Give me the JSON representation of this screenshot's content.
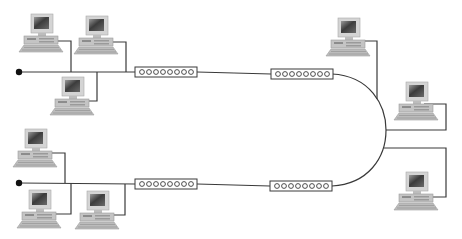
{
  "diagram": {
    "type": "network-topology",
    "background": "#ffffff",
    "line_color": "#3a3a3a",
    "segments": [
      {
        "name": "upper-bus",
        "terminator": {
          "x": 19,
          "y": 72
        },
        "bus_y": 72,
        "workstations": [
          {
            "id": "ws-upper-1",
            "x": 22,
            "y": 14,
            "drop_x": 71
          },
          {
            "id": "ws-upper-2",
            "x": 77,
            "y": 16,
            "drop_x": 126
          },
          {
            "id": "ws-upper-3",
            "x": 53,
            "y": 77,
            "drop_x": 97,
            "below": true
          }
        ],
        "repeaters": [
          {
            "id": "repeater-upper-left",
            "x": 135,
            "y": 67,
            "ports": 8
          },
          {
            "id": "repeater-upper-right",
            "x": 271,
            "y": 69,
            "ports": 8
          }
        ]
      },
      {
        "name": "lower-bus",
        "terminator": {
          "x": 19,
          "y": 183
        },
        "bus_y": 183,
        "workstations": [
          {
            "id": "ws-lower-1",
            "x": 16,
            "y": 129,
            "drop_x": 65
          },
          {
            "id": "ws-lower-2",
            "x": 20,
            "y": 190,
            "drop_x": 71,
            "below": true
          },
          {
            "id": "ws-lower-3",
            "x": 78,
            "y": 191,
            "drop_x": 125,
            "below": true
          }
        ],
        "repeaters": [
          {
            "id": "repeater-lower-left",
            "x": 135,
            "y": 179,
            "ports": 8
          },
          {
            "id": "repeater-lower-right",
            "x": 270,
            "y": 181,
            "ports": 8
          }
        ]
      }
    ],
    "backbone_arc": {
      "start_x": 332,
      "top_y": 74,
      "bottom_y": 186,
      "apex_x": 386
    },
    "right_workstations": [
      {
        "id": "ws-right-1",
        "x": 329,
        "y": 18,
        "drop_y": 41,
        "join_x": 377
      },
      {
        "id": "ws-right-2",
        "x": 397,
        "y": 82,
        "drop_y": 105,
        "join_y": 130
      },
      {
        "id": "ws-right-3",
        "x": 397,
        "y": 172,
        "drop_y": 197,
        "join_y": 148
      }
    ]
  }
}
